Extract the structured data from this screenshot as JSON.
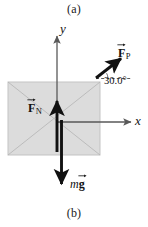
{
  "figure": {
    "caption_top": "(a)",
    "caption_bottom": "(b)",
    "width": 148,
    "height": 227
  },
  "axes": {
    "y_label": "y",
    "x_label": "x",
    "origin": {
      "x": 57,
      "y": 122
    },
    "y_axis": {
      "x": 57,
      "y_top": 34,
      "y_bottom": 150
    },
    "x_axis": {
      "y": 122,
      "x_left": 57,
      "x_right": 133
    },
    "color": "#595959"
  },
  "object_box": {
    "name": "crate",
    "x": 8,
    "y": 82,
    "width": 92,
    "height": 73,
    "fill": "#dcdcdc",
    "stroke": "#c0c0c0",
    "diagonals": true
  },
  "vectors": [
    {
      "id": "force-applied",
      "symbol": "F",
      "subscript": "P",
      "label": "FP",
      "x1": 96,
      "y1": 78,
      "x2": 123,
      "y2": 57,
      "color": "#111111",
      "label_x": 118,
      "label_y": 44
    },
    {
      "id": "force-normal",
      "symbol": "F",
      "subscript": "N",
      "label": "FN",
      "x1": 57,
      "y1": 152,
      "x2": 57,
      "y2": 99,
      "color": "#111111",
      "label_x": 28,
      "label_y": 99
    },
    {
      "id": "weight",
      "symbol": "g",
      "prefix": "m",
      "label": "mg",
      "x1": 61,
      "y1": 122,
      "x2": 61,
      "y2": 186,
      "color": "#111111",
      "label_x": 70,
      "label_y": 178
    }
  ],
  "angle": {
    "value": "30.0",
    "unit": "°",
    "text": "30.0°",
    "reference_line": {
      "x1": 96,
      "y1": 78,
      "x2": 130,
      "y2": 78,
      "dashed": true
    },
    "label_x": 104,
    "label_y": 76
  },
  "colors": {
    "background": "#ffffff",
    "box_fill": "#dcdcdc",
    "box_stroke": "#c0c0c0",
    "axis": "#595959",
    "vector": "#111111",
    "text": "#111111"
  }
}
